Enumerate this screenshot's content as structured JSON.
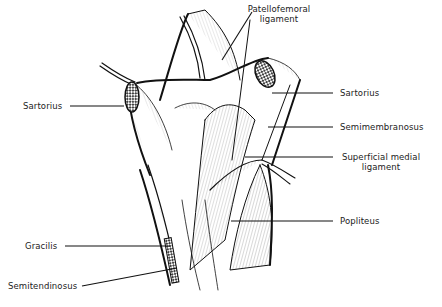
{
  "figure": {
    "labels": {
      "patellofemoral_line1": "Patellofemoral",
      "patellofemoral_line2": "ligament",
      "sartorius_left": "Sartorius",
      "sartorius_right": "Sartorius",
      "semimembranosus": "Semimembranosus",
      "superficial_medial_line1": "Superficial medial",
      "superficial_medial_line2": "ligament",
      "popliteus": "Popliteus",
      "gracilis": "Gracilis",
      "semitendinosus": "Semitendinosus"
    },
    "colors": {
      "ink": "#111111",
      "background": "#ffffff",
      "text": "#222222"
    }
  }
}
